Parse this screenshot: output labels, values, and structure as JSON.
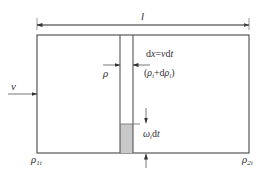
{
  "diagram": {
    "length_label": "l",
    "velocity_label": "v",
    "displacement_label": "dx=vdt",
    "density_left_label": "ρ",
    "density_right_label": "(ρi+dρi)",
    "settling_label": "ωidt",
    "inlet_density": "ρ1i",
    "outlet_density": "ρ2i",
    "colors": {
      "line": "#555555",
      "shading": "#c8c8c8",
      "text": "#333333"
    }
  }
}
